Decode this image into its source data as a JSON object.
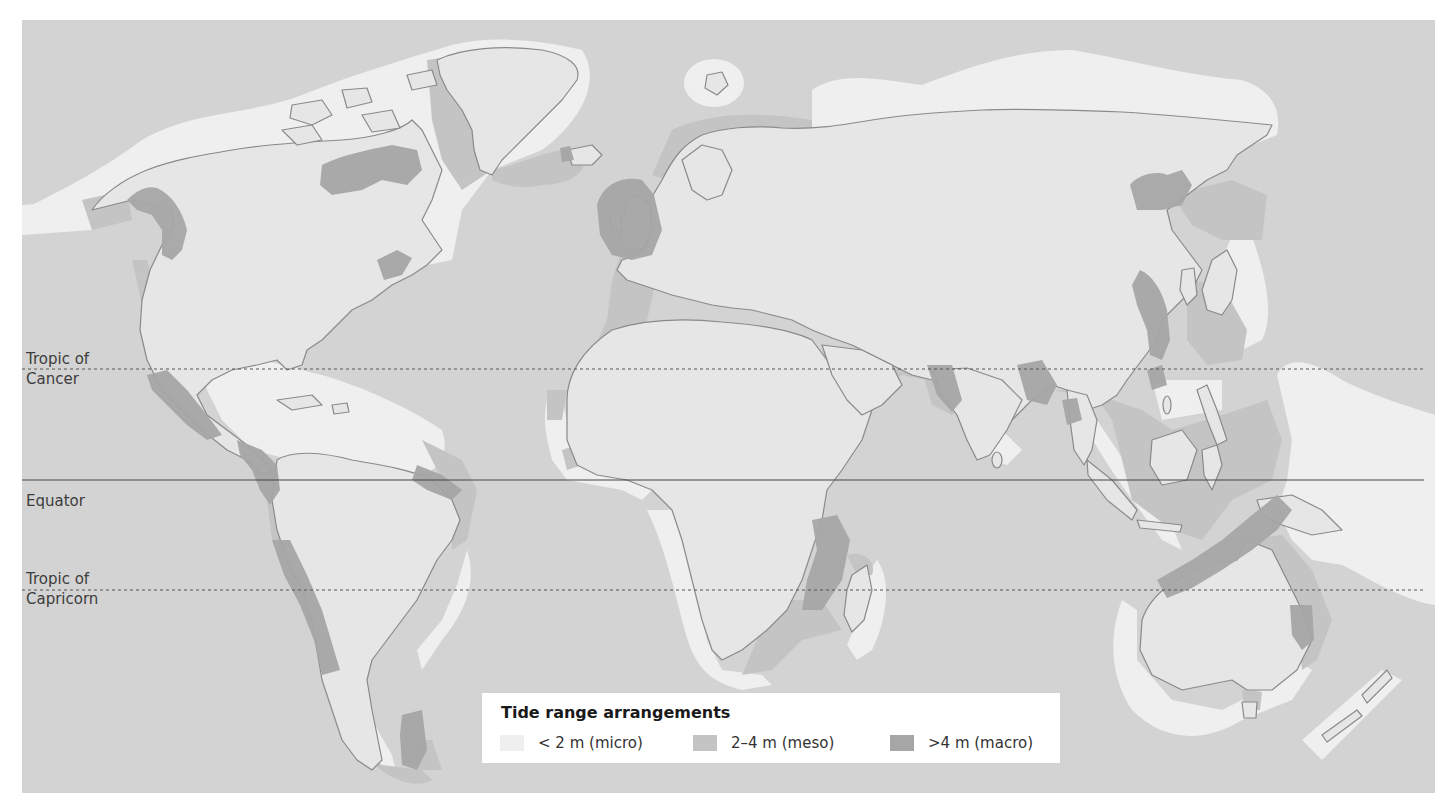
{
  "map": {
    "title": "Tide range arrangements",
    "colors": {
      "ocean": "#d3d3d3",
      "land": "#e6e6e6",
      "coastline": "#8a8a8a",
      "micro": "#efefef",
      "meso": "#c4c4c4",
      "macro": "#a6a6a6",
      "lat_line": "#555555"
    },
    "latitude_lines": [
      {
        "name": "Tropic of Cancer",
        "label_line1": "Tropic of",
        "label_line2": "Cancer",
        "style": "dotted"
      },
      {
        "name": "Equator",
        "label_line1": "Equator",
        "label_line2": "",
        "style": "solid"
      },
      {
        "name": "Tropic of Capricorn",
        "label_line1": "Tropic of",
        "label_line2": "Capricorn",
        "style": "dotted"
      }
    ]
  },
  "legend": {
    "title": "Tide range arrangements",
    "items": [
      {
        "label": "< 2 m (micro)",
        "category": "micro",
        "color": "#efefef"
      },
      {
        "label": "2–4 m (meso)",
        "category": "meso",
        "color": "#c4c4c4"
      },
      {
        "label": ">4 m (macro)",
        "category": "macro",
        "color": "#a6a6a6"
      }
    ]
  }
}
